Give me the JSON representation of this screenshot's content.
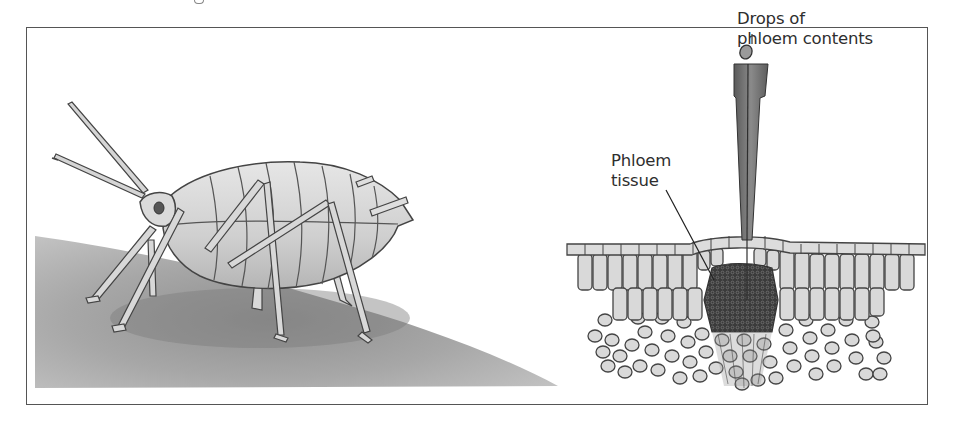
{
  "figure": {
    "type": "scientific illustration",
    "panels": [
      {
        "id": "aphid",
        "description": "Aphid standing on a plant stem/leaf surface",
        "subject": "aphid"
      },
      {
        "id": "stylet-section",
        "description": "Cross-section of a plant stem with a severed aphid stylet inserted into the phloem, exuding a droplet",
        "subject": "aphid stylet in phloem"
      }
    ],
    "labels": {
      "drops": {
        "line1": "Drops of",
        "line2": "phloem contents"
      },
      "phloem_tissue": {
        "line1": "Phloem",
        "line2": "tissue"
      }
    },
    "colors": {
      "frame": "#555555",
      "text": "#2e2e2e",
      "leaf_surface": "#a9a9a9",
      "aphid_body": "#d4d4d4",
      "cell_fill": "#d9d9d9",
      "phloem_dark": "#3a3a3a",
      "stylet": "#6e6e6e"
    }
  }
}
